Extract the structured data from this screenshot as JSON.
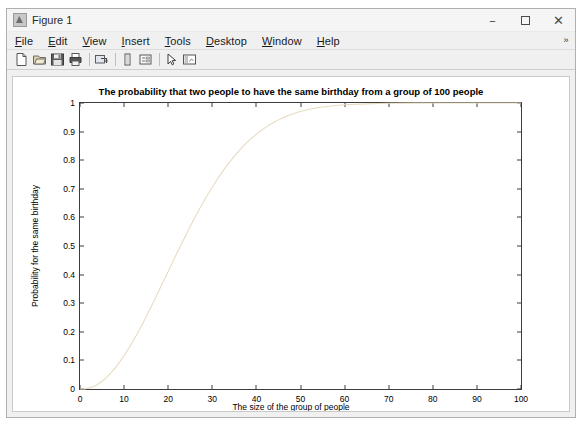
{
  "window": {
    "title": "Figure 1",
    "icon": "matlab-figure-icon",
    "controls": {
      "minimize": "–",
      "maximize": "maximize-icon",
      "close": "✕"
    }
  },
  "menubar": {
    "overflow": "»",
    "items": [
      {
        "name": "file",
        "label": "File",
        "mnemonic": "F"
      },
      {
        "name": "edit",
        "label": "Edit",
        "mnemonic": "E"
      },
      {
        "name": "view",
        "label": "View",
        "mnemonic": "V"
      },
      {
        "name": "insert",
        "label": "Insert",
        "mnemonic": "I"
      },
      {
        "name": "tools",
        "label": "Tools",
        "mnemonic": "T"
      },
      {
        "name": "desktop",
        "label": "Desktop",
        "mnemonic": "D"
      },
      {
        "name": "window",
        "label": "Window",
        "mnemonic": "W"
      },
      {
        "name": "help",
        "label": "Help",
        "mnemonic": "H"
      }
    ]
  },
  "toolbar": {
    "buttons": [
      {
        "name": "new-figure-icon",
        "tooltip": "New Figure"
      },
      {
        "name": "open-file-icon",
        "tooltip": "Open File"
      },
      {
        "name": "save-figure-icon",
        "tooltip": "Save Figure"
      },
      {
        "name": "print-figure-icon",
        "tooltip": "Print Figure"
      },
      {
        "name": "link-plot-icon",
        "tooltip": "Link Plot"
      },
      {
        "name": "insert-colorbar-icon",
        "tooltip": "Insert Colorbar"
      },
      {
        "name": "insert-legend-icon",
        "tooltip": "Insert Legend"
      },
      {
        "name": "edit-plot-icon",
        "tooltip": "Edit Plot"
      },
      {
        "name": "show-plot-tools-icon",
        "tooltip": "Show Plot Tools and Dock Figure"
      }
    ]
  },
  "chart_data": {
    "type": "line",
    "title": "The probability that two people to have the same birthday from a group of 100 people",
    "xlabel": "The size of the group of people",
    "ylabel": "Probability for the same birthday",
    "xlim": [
      0,
      100
    ],
    "ylim": [
      0,
      1
    ],
    "xticks": [
      0,
      10,
      20,
      30,
      40,
      50,
      60,
      70,
      80,
      90,
      100
    ],
    "yticks": [
      0,
      0.1,
      0.2,
      0.3,
      0.4,
      0.5,
      0.6,
      0.7,
      0.8,
      0.9,
      1
    ],
    "grid": false,
    "legend": null,
    "series": [
      {
        "name": "birthday-probability",
        "color": "#e8dcc0",
        "line_width": 1,
        "x": [
          0,
          1,
          2,
          3,
          4,
          5,
          6,
          7,
          8,
          9,
          10,
          11,
          12,
          13,
          14,
          15,
          16,
          17,
          18,
          19,
          20,
          21,
          22,
          23,
          24,
          25,
          26,
          27,
          28,
          29,
          30,
          31,
          32,
          33,
          34,
          35,
          36,
          37,
          38,
          39,
          40,
          41,
          42,
          43,
          44,
          45,
          46,
          47,
          48,
          49,
          50,
          52,
          54,
          56,
          58,
          60,
          65,
          70,
          75,
          80,
          85,
          90,
          95,
          100
        ],
        "y": [
          0,
          0,
          0.003,
          0.008,
          0.016,
          0.027,
          0.04,
          0.056,
          0.074,
          0.095,
          0.117,
          0.141,
          0.167,
          0.194,
          0.223,
          0.253,
          0.284,
          0.315,
          0.347,
          0.379,
          0.411,
          0.444,
          0.476,
          0.507,
          0.538,
          0.569,
          0.598,
          0.627,
          0.654,
          0.681,
          0.706,
          0.73,
          0.753,
          0.775,
          0.795,
          0.814,
          0.832,
          0.849,
          0.864,
          0.878,
          0.891,
          0.903,
          0.914,
          0.924,
          0.933,
          0.941,
          0.948,
          0.955,
          0.961,
          0.966,
          0.97,
          0.978,
          0.984,
          0.988,
          0.991,
          0.994,
          0.997,
          0.999,
          0.9997,
          0.9999,
          1,
          1,
          1,
          1
        ]
      }
    ]
  }
}
